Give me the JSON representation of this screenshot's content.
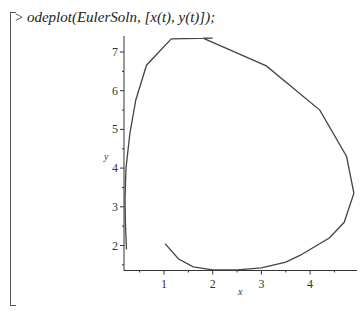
{
  "command": {
    "prompt": ">",
    "text": "odeplot(EulerSoln, [x(t), y(t)]);"
  },
  "chart_data": {
    "type": "line",
    "title": "",
    "xlabel": "x",
    "ylabel": "y",
    "xlim": [
      0.14,
      4.95
    ],
    "ylim": [
      1.37,
      7.36
    ],
    "xticks": [
      1,
      2,
      3,
      4
    ],
    "yticks": [
      2,
      3,
      4,
      5,
      6,
      7
    ],
    "grid": false,
    "legend": null,
    "series": [
      {
        "name": "EulerSoln [x(t), y(t)]",
        "color": "#444444",
        "x": [
          1.02,
          1.3,
          1.6,
          2.0,
          2.5,
          3.0,
          3.5,
          3.8,
          4.4,
          4.7,
          4.9,
          4.75,
          4.2,
          3.1,
          1.8,
          2.0,
          1.15,
          0.64,
          0.42,
          0.3,
          0.22,
          0.2,
          0.21,
          0.23
        ],
        "y": [
          2.05,
          1.65,
          1.45,
          1.37,
          1.37,
          1.42,
          1.57,
          1.75,
          2.2,
          2.6,
          3.35,
          4.3,
          5.5,
          6.64,
          7.36,
          7.36,
          7.34,
          6.66,
          5.76,
          4.9,
          4.0,
          3.2,
          2.5,
          1.9
        ]
      }
    ]
  }
}
